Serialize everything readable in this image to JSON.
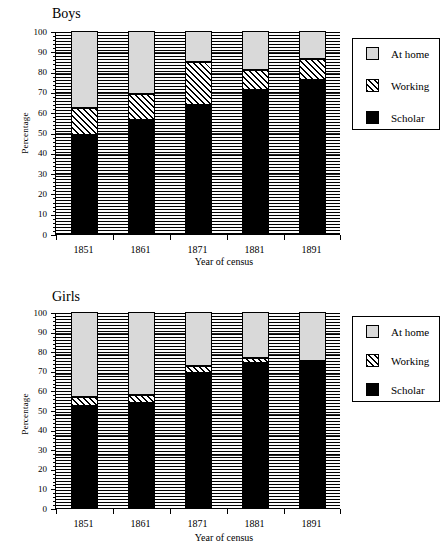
{
  "figure": {
    "charts": [
      {
        "id": "boys",
        "title": "Boys",
        "xlabel": "Year of census",
        "ylabel": "Percentage"
      },
      {
        "id": "girls",
        "title": "Girls",
        "xlabel": "Year of census",
        "ylabel": "Percentage"
      }
    ],
    "legend": {
      "items": [
        {
          "label": "At home",
          "swatch": "athome",
          "color": "#d9d9d9"
        },
        {
          "label": "Working",
          "swatch": "working",
          "color": "#ffffff"
        },
        {
          "label": "Scholar",
          "swatch": "scholar",
          "color": "#000000"
        }
      ]
    },
    "yticks": [
      "0",
      "10",
      "20",
      "30",
      "40",
      "50",
      "60",
      "70",
      "80",
      "90",
      "100"
    ]
  },
  "chart_data": [
    {
      "type": "bar",
      "subtype": "stacked",
      "title": "Boys",
      "xlabel": "Year of census",
      "ylabel": "Percentage",
      "categories": [
        "1851",
        "1861",
        "1871",
        "1881",
        "1891"
      ],
      "ylim": [
        0,
        100
      ],
      "ytick_interval": 10,
      "yticks": [
        0,
        10,
        20,
        30,
        40,
        50,
        60,
        70,
        80,
        90,
        100
      ],
      "grid": true,
      "legend_position": "right",
      "stack_order": [
        "Scholar",
        "Working",
        "At home"
      ],
      "series": [
        {
          "name": "Scholar",
          "values": [
            49,
            56,
            63.5,
            71,
            76
          ]
        },
        {
          "name": "Working",
          "values": [
            13,
            13,
            21,
            10,
            10
          ]
        },
        {
          "name": "At home",
          "values": [
            38,
            31,
            15.5,
            19,
            14
          ]
        }
      ],
      "cumulative_tops": {
        "Scholar": [
          49,
          56,
          63.5,
          71,
          76
        ],
        "Working": [
          62,
          69,
          84.5,
          81,
          86
        ],
        "At home": [
          100,
          100,
          100,
          100,
          100
        ]
      }
    },
    {
      "type": "bar",
      "subtype": "stacked",
      "title": "Girls",
      "xlabel": "Year of census",
      "ylabel": "Percentage",
      "categories": [
        "1851",
        "1861",
        "1871",
        "1881",
        "1891"
      ],
      "ylim": [
        0,
        100
      ],
      "ytick_interval": 10,
      "yticks": [
        0,
        10,
        20,
        30,
        40,
        50,
        60,
        70,
        80,
        90,
        100
      ],
      "grid": true,
      "legend_position": "right",
      "stack_order": [
        "Scholar",
        "Working",
        "At home"
      ],
      "series": [
        {
          "name": "Scholar",
          "values": [
            52,
            53.5,
            69,
            74,
            75
          ]
        },
        {
          "name": "Working",
          "values": [
            4.5,
            4,
            3.5,
            2.5,
            0
          ]
        },
        {
          "name": "At home",
          "values": [
            43.5,
            42.5,
            27.5,
            23.5,
            25
          ]
        }
      ],
      "cumulative_tops": {
        "Scholar": [
          52,
          53.5,
          69,
          74,
          75
        ],
        "Working": [
          56.5,
          57.5,
          72.5,
          76.5,
          75
        ],
        "At home": [
          100,
          100,
          100,
          100,
          100
        ]
      }
    }
  ]
}
